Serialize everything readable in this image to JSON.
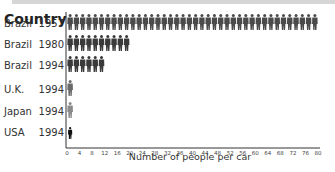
{
  "chart_data": {
    "type": "bar",
    "style": "pictogram",
    "title": "Country",
    "xlabel": "Number of people per car",
    "ylabel": "",
    "xlim": [
      0,
      80
    ],
    "xticks": [
      0,
      4,
      8,
      12,
      16,
      20,
      24,
      28,
      32,
      36,
      40,
      44,
      48,
      52,
      56,
      60,
      64,
      68,
      72,
      76,
      80
    ],
    "people_per_icon": 2,
    "categories": [
      {
        "country": "Brazil",
        "year": "1957",
        "icon_color": "#4a4a4a"
      },
      {
        "country": "Brazil",
        "year": "1980",
        "icon_color": "#3a3a3a"
      },
      {
        "country": "Brazil",
        "year": "1994",
        "icon_color": "#3a3a3a"
      },
      {
        "country": "U.K.",
        "year": "1994",
        "icon_color": "#6a6a6a"
      },
      {
        "country": "Japan",
        "year": "1994",
        "icon_color": "#8a8a8a"
      },
      {
        "country": "USA",
        "year": "1994",
        "icon_color": "#111111"
      }
    ],
    "values": [
      79,
      19,
      11,
      2,
      2,
      1.5
    ],
    "grid": false,
    "legend": "none"
  }
}
